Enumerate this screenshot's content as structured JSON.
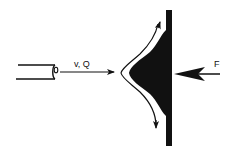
{
  "diagram": {
    "type": "jet-impinging-on-plate",
    "labels": {
      "jet": "v, Q",
      "force": "F"
    },
    "colors": {
      "ink": "#111111",
      "background": "#ffffff"
    },
    "elements": [
      {
        "id": "nozzle",
        "description": "horizontal pipe/nozzle on the left with open circular end"
      },
      {
        "id": "jet-arrow",
        "description": "arrow from nozzle toward plate labeled v, Q"
      },
      {
        "id": "deflected-flow",
        "description": "jet deflected into upward and downward streams hugging a black conical deflector"
      },
      {
        "id": "plate",
        "description": "vertical black wall with solid black bulge facing the jet"
      },
      {
        "id": "force-arrow",
        "description": "arrow pointing left toward the plate labeled F"
      }
    ]
  }
}
